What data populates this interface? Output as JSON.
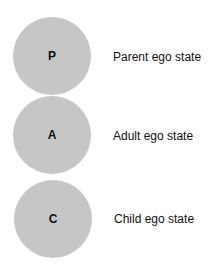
{
  "diagram": {
    "states": [
      {
        "letter": "P",
        "label": "Parent ego state"
      },
      {
        "letter": "A",
        "label": "Adult ego state"
      },
      {
        "letter": "C",
        "label": "Child ego state"
      }
    ],
    "colors": {
      "circle_fill": "#c6c6c6",
      "text": "#111111",
      "background": "#ffffff"
    }
  }
}
